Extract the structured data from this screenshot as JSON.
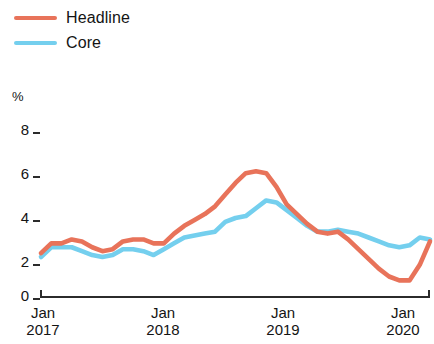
{
  "legend": {
    "position": "top-left",
    "entries": [
      {
        "label": "Headline",
        "color": "#e8735a",
        "name": "headline"
      },
      {
        "label": "Core",
        "color": "#74cfee",
        "name": "core"
      }
    ]
  },
  "axes": {
    "unit": "%",
    "y_ticks": [
      "0",
      "2",
      "4",
      "6",
      "8"
    ],
    "x_ticks": [
      {
        "month": "Jan",
        "year": "2017"
      },
      {
        "month": "Jan",
        "year": "2018"
      },
      {
        "month": "Jan",
        "year": "2019"
      },
      {
        "month": "Jan",
        "year": "2020"
      }
    ]
  },
  "chart_data": {
    "type": "line",
    "title": "",
    "subtitle": "",
    "xlabel": "",
    "ylabel": "%",
    "ylim": [
      0,
      8
    ],
    "yticks": [
      0,
      2,
      4,
      6,
      8
    ],
    "grid": false,
    "legend_position": "top-left",
    "x_axis_type": "monthly",
    "x_start": "2017-01",
    "x_end": "2020-03",
    "x_tick_labels": [
      "Jan 2017",
      "Jan 2018",
      "Jan 2019",
      "Jan 2020"
    ],
    "x": [
      "2017-01",
      "2017-02",
      "2017-03",
      "2017-04",
      "2017-05",
      "2017-06",
      "2017-07",
      "2017-08",
      "2017-09",
      "2017-10",
      "2017-11",
      "2017-12",
      "2018-01",
      "2018-02",
      "2018-03",
      "2018-04",
      "2018-05",
      "2018-06",
      "2018-07",
      "2018-08",
      "2018-09",
      "2018-10",
      "2018-11",
      "2018-12",
      "2019-01",
      "2019-02",
      "2019-03",
      "2019-04",
      "2019-05",
      "2019-06",
      "2019-07",
      "2019-08",
      "2019-09",
      "2019-10",
      "2019-11",
      "2019-12",
      "2020-01",
      "2020-02",
      "2020-03"
    ],
    "series": [
      {
        "name": "Headline",
        "color": "#e8735a",
        "values": [
          2.2,
          2.7,
          2.7,
          2.9,
          2.8,
          2.5,
          2.3,
          2.4,
          2.8,
          2.9,
          2.9,
          2.7,
          2.7,
          3.2,
          3.6,
          3.9,
          4.2,
          4.6,
          5.2,
          5.8,
          6.3,
          6.4,
          6.3,
          5.6,
          4.7,
          4.2,
          3.7,
          3.3,
          3.2,
          3.3,
          2.9,
          2.4,
          1.9,
          1.4,
          1.0,
          0.8,
          0.8,
          1.6,
          2.8
        ]
      },
      {
        "name": "Core",
        "color": "#74cfee",
        "values": [
          2.0,
          2.5,
          2.5,
          2.5,
          2.3,
          2.1,
          2.0,
          2.1,
          2.4,
          2.4,
          2.3,
          2.1,
          2.4,
          2.7,
          3.0,
          3.1,
          3.2,
          3.3,
          3.8,
          4.0,
          4.1,
          4.5,
          4.9,
          4.8,
          4.4,
          4.0,
          3.6,
          3.3,
          3.3,
          3.4,
          3.3,
          3.2,
          3.0,
          2.8,
          2.6,
          2.5,
          2.6,
          3.0,
          2.9
        ]
      }
    ]
  }
}
